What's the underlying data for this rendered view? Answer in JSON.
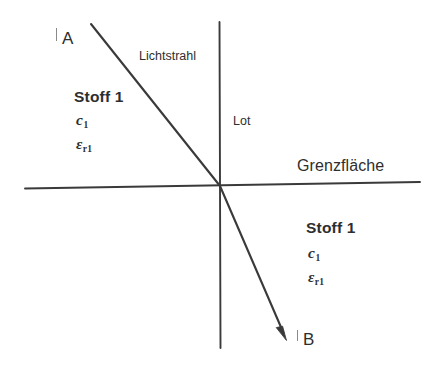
{
  "figure": {
    "type": "optics-refraction-diagram",
    "background_color": "#ffffff",
    "stroke_color": "#3a3a3a",
    "text_color": "#2e2e2e"
  },
  "labels": {
    "point_a": "A",
    "point_b": "B",
    "ray": "Lichtstrahl",
    "normal": "Lot",
    "interface": "Grenzfläche"
  },
  "medium_upper": {
    "name": "Stoff 1",
    "speed_symbol": "c",
    "speed_subscript": "1",
    "permittivity_symbol": "ε",
    "permittivity_subscript": "r1"
  },
  "medium_lower": {
    "name": "Stoff 1",
    "speed_symbol": "c",
    "speed_subscript": "1",
    "permittivity_symbol": "ε",
    "permittivity_subscript": "r1"
  },
  "geometry": {
    "interface_line": {
      "x1": 25,
      "y1": 188,
      "x2": 420,
      "y2": 182
    },
    "normal_line": {
      "x1": 219,
      "y1": 22,
      "x2": 220,
      "y2": 348
    },
    "incident_ray": {
      "x1": 91,
      "y1": 24,
      "x2": 220,
      "y2": 186
    },
    "refracted_ray": {
      "x1": 220,
      "y1": 186,
      "x2": 286,
      "y2": 339
    },
    "intersection": {
      "x": 220,
      "y": 186
    }
  }
}
